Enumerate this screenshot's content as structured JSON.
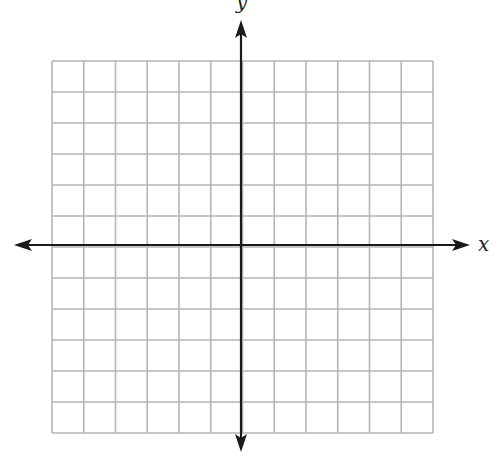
{
  "diagram": {
    "type": "coordinate-plane",
    "x_axis_label": "x",
    "y_axis_label": "y",
    "grid": {
      "columns": 12,
      "rows": 12,
      "left": 52,
      "top": 61,
      "right": 433,
      "bottom": 433,
      "line_color": "#b5b5b5"
    },
    "axis": {
      "origin_x": 241,
      "origin_y": 245,
      "x_start": 14,
      "x_end": 470,
      "y_start": 20,
      "y_end": 452,
      "color": "#1a1a1a"
    }
  }
}
